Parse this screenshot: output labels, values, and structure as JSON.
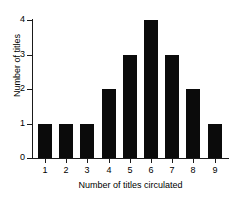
{
  "chart_data": {
    "type": "bar",
    "title": "",
    "subtitle": "",
    "xlabel": "Number of titles circulated",
    "ylabel": "Number of titles",
    "categories": [
      "1",
      "2",
      "3",
      "4",
      "5",
      "6",
      "7",
      "8",
      "9"
    ],
    "values": [
      1,
      1,
      1,
      2,
      3,
      4,
      3,
      2,
      1
    ],
    "ylim": [
      0,
      4
    ],
    "y_ticks": [
      "0",
      "1",
      "2",
      "3",
      "4"
    ],
    "y_tick_values": [
      0,
      1,
      2,
      3,
      4
    ],
    "grid": false,
    "legend": false,
    "legend_position": "none",
    "bar_color": "#0b0b0b",
    "axis_color": "#1a1a1a",
    "background_color": "#ffffff"
  }
}
